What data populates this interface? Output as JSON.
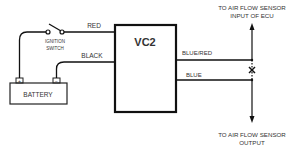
{
  "diagram": {
    "module": {
      "label": "VC2"
    },
    "battery": {
      "label": "BATTERY",
      "positive": "+",
      "negative": "−"
    },
    "ignition_switch": {
      "line1": "IGNITION",
      "line2": "SWITCH"
    },
    "wires": {
      "red": "RED",
      "black": "BLACK",
      "blue_red": "BLUE/RED",
      "blue": "BLUE"
    },
    "top_destination": {
      "line1": "TO AIR FLOW SENSOR",
      "line2": "INPUT OF ECU"
    },
    "bottom_destination": {
      "line1": "TO AIR FLOW SENSOR",
      "line2": "OUTPUT"
    },
    "cut_mark": "X",
    "colors": {
      "line": "#111111",
      "text": "#333333",
      "background": "#ffffff"
    }
  }
}
